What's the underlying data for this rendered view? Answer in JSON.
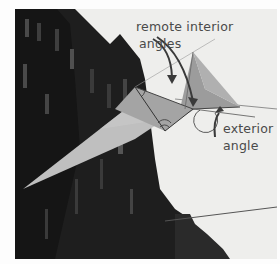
{
  "figure": {
    "annotations": {
      "remote_interior": {
        "line1": "remote interior",
        "line2": "angles"
      },
      "exterior": {
        "line1": "exterior",
        "line2": "angle"
      }
    },
    "colors": {
      "sky": "#eeeeec",
      "building": "#1c1c1c",
      "kite_light": "#bdbdbd",
      "kite_mid": "#a6a6a6",
      "kite_dark": "#8e8e8e",
      "annotation": "#4a4a4a",
      "arrow": "#3a3a3a"
    }
  }
}
